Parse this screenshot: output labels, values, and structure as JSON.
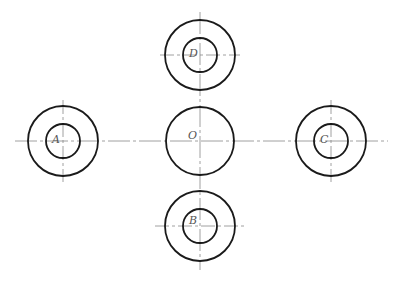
{
  "diagram": {
    "type": "geometry",
    "stroke_color": "#1a1a1a",
    "centerline_color": "#777777",
    "circles": [
      {
        "id": "D",
        "label": "D",
        "cx": 200,
        "cy": 55,
        "outer_r": 35,
        "inner_r": 17
      },
      {
        "id": "A",
        "label": "A",
        "cx": 63,
        "cy": 141,
        "outer_r": 35,
        "inner_r": 17
      },
      {
        "id": "O",
        "label": "O",
        "cx": 200,
        "cy": 141,
        "outer_r": 34,
        "inner_r": null
      },
      {
        "id": "C",
        "label": "C",
        "cx": 331,
        "cy": 141,
        "outer_r": 35,
        "inner_r": 17
      },
      {
        "id": "B",
        "label": "B",
        "cx": 200,
        "cy": 226,
        "outer_r": 35,
        "inner_r": 17
      }
    ]
  }
}
